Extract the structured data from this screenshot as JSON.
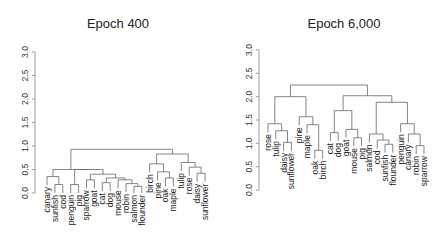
{
  "chart_data": [
    {
      "type": "dendrogram",
      "title": "Epoch 400",
      "xlabel": "",
      "ylabel": "",
      "ylim": [
        0,
        3.0
      ],
      "yticks": [
        "0.0",
        "0.5",
        "1.0",
        "1.5",
        "2.0",
        "2.5",
        "3.0"
      ],
      "leaves": [
        "canary",
        "sunfish",
        "cod",
        "penguin",
        "pig",
        "sparrow",
        "goat",
        "cat",
        "dog",
        "mouse",
        "robin",
        "salmon",
        "flounder",
        "birch",
        "pine",
        "oak",
        "maple",
        "tulip",
        "rose",
        "daisy",
        "sunflower"
      ],
      "merges": [
        {
          "a": "sunfish",
          "b": "cod",
          "h": 0.18
        },
        {
          "a": "canary",
          "b": [
            "sunfish",
            "cod"
          ],
          "h": 0.35
        },
        {
          "a": "penguin",
          "b": "pig",
          "h": 0.18
        },
        {
          "a": "cat",
          "b": "dog",
          "h": 0.22
        },
        {
          "a": "salmon",
          "b": "flounder",
          "h": 0.14
        },
        {
          "a": "robin",
          "b": [
            "salmon",
            "flounder"
          ],
          "h": 0.2
        },
        {
          "a": "mouse",
          "b": [
            "robin",
            "salmon",
            "flounder"
          ],
          "h": 0.28
        },
        {
          "a": [
            "cat",
            "dog"
          ],
          "b": [
            "mouse",
            "robin",
            "salmon",
            "flounder"
          ],
          "h": 0.32
        },
        {
          "a": "sparrow",
          "b": "goat",
          "h": 0.28
        },
        {
          "a": [
            "sparrow",
            "goat"
          ],
          "b": [
            "cat",
            "dog",
            "mouse",
            "robin",
            "salmon",
            "flounder"
          ],
          "h": 0.4
        },
        {
          "a": [
            "penguin",
            "pig"
          ],
          "b": [
            "sparrow",
            "goat",
            "cat",
            "dog",
            "mouse",
            "robin",
            "salmon",
            "flounder"
          ],
          "h": 0.5
        },
        {
          "a": [
            "canary",
            "sunfish",
            "cod"
          ],
          "b": [
            "penguin",
            "pig",
            "sparrow",
            "goat",
            "cat",
            "dog",
            "mouse",
            "robin",
            "salmon",
            "flounder"
          ],
          "h": 0.5
        },
        {
          "a": "oak",
          "b": "maple",
          "h": 0.32
        },
        {
          "a": "pine",
          "b": [
            "oak",
            "maple"
          ],
          "h": 0.45
        },
        {
          "a": "birch",
          "b": [
            "pine",
            "oak",
            "maple"
          ],
          "h": 0.62
        },
        {
          "a": "daisy",
          "b": "sunflower",
          "h": 0.42
        },
        {
          "a": "rose",
          "b": [
            "daisy",
            "sunflower"
          ],
          "h": 0.55
        },
        {
          "a": "tulip",
          "b": [
            "rose",
            "daisy",
            "sunflower"
          ],
          "h": 0.65
        },
        {
          "a": [
            "birch",
            "pine",
            "oak",
            "maple"
          ],
          "b": [
            "tulip",
            "rose",
            "daisy",
            "sunflower"
          ],
          "h": 0.83
        },
        {
          "a": "animals",
          "b": "plants",
          "h": 0.93
        }
      ]
    },
    {
      "type": "dendrogram",
      "title": "Epoch 6,000",
      "xlabel": "",
      "ylabel": "",
      "ylim": [
        0,
        3.0
      ],
      "yticks": [
        "0.0",
        "0.5",
        "1.0",
        "1.5",
        "2.0",
        "2.5",
        "3.0"
      ],
      "leaves": [
        "rose",
        "tulip",
        "daisy",
        "sunflower",
        "pine",
        "maple",
        "oak",
        "birch",
        "cat",
        "dog",
        "goat",
        "mouse",
        "pig",
        "salmon",
        "cod",
        "sunfish",
        "flounder",
        "penguin",
        "canary",
        "robin",
        "sparrow"
      ],
      "merges": [
        {
          "a": "daisy",
          "b": "sunflower",
          "h": 1.02
        },
        {
          "a": "tulip",
          "b": [
            "daisy",
            "sunflower"
          ],
          "h": 1.27
        },
        {
          "a": "rose",
          "b": [
            "tulip",
            "daisy",
            "sunflower"
          ],
          "h": 1.42
        },
        {
          "a": "oak",
          "b": "birch",
          "h": 0.85
        },
        {
          "a": "maple",
          "b": [
            "oak",
            "birch"
          ],
          "h": 1.4
        },
        {
          "a": "pine",
          "b": [
            "maple",
            "oak",
            "birch"
          ],
          "h": 1.57
        },
        {
          "a": [
            "rose",
            "tulip",
            "daisy",
            "sunflower"
          ],
          "b": [
            "pine",
            "maple",
            "oak",
            "birch"
          ],
          "h": 2.0
        },
        {
          "a": "cat",
          "b": "dog",
          "h": 1.23
        },
        {
          "a": "mouse",
          "b": "pig",
          "h": 1.12
        },
        {
          "a": "goat",
          "b": [
            "mouse",
            "pig"
          ],
          "h": 1.3
        },
        {
          "a": [
            "cat",
            "dog"
          ],
          "b": [
            "goat",
            "mouse",
            "pig"
          ],
          "h": 1.7
        },
        {
          "a": "sunfish",
          "b": "flounder",
          "h": 0.98
        },
        {
          "a": "cod",
          "b": [
            "sunfish",
            "flounder"
          ],
          "h": 1.07
        },
        {
          "a": "salmon",
          "b": [
            "cod",
            "sunfish",
            "flounder"
          ],
          "h": 1.2
        },
        {
          "a": "robin",
          "b": "sparrow",
          "h": 0.95
        },
        {
          "a": "canary",
          "b": [
            "robin",
            "sparrow"
          ],
          "h": 1.2
        },
        {
          "a": "penguin",
          "b": [
            "canary",
            "robin",
            "sparrow"
          ],
          "h": 1.42
        },
        {
          "a": [
            "salmon",
            "cod",
            "sunfish",
            "flounder"
          ],
          "b": [
            "penguin",
            "canary",
            "robin",
            "sparrow"
          ],
          "h": 1.88
        },
        {
          "a": [
            "cat",
            "dog",
            "goat",
            "mouse",
            "pig"
          ],
          "b": [
            "salmon",
            "cod",
            "sunfish",
            "flounder",
            "penguin",
            "canary",
            "robin",
            "sparrow"
          ],
          "h": 2.02
        },
        {
          "a": "plants",
          "b": "animals",
          "h": 2.25
        }
      ]
    }
  ],
  "panels": [
    {
      "title": "Epoch 400"
    },
    {
      "title": "Epoch 6,000"
    }
  ]
}
